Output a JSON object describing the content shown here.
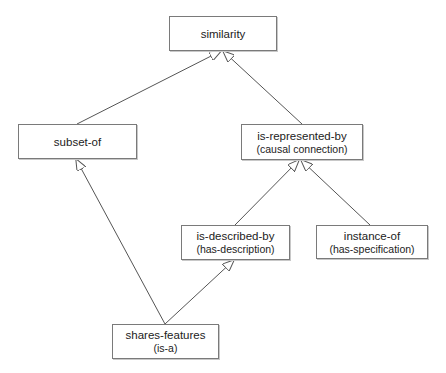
{
  "caption_cutoff": "",
  "diagram": {
    "nodes": [
      {
        "id": "similarity",
        "label": "similarity",
        "sublabel": ""
      },
      {
        "id": "subset-of",
        "label": "subset-of",
        "sublabel": ""
      },
      {
        "id": "is-represented-by",
        "label": "is-represented-by",
        "sublabel": "(causal connection)"
      },
      {
        "id": "is-described-by",
        "label": "is-described-by",
        "sublabel": "(has-description)"
      },
      {
        "id": "instance-of",
        "label": "instance-of",
        "sublabel": "(has-specification)"
      },
      {
        "id": "shares-features",
        "label": "shares-features",
        "sublabel": "(is-a)"
      }
    ],
    "edges": [
      {
        "from": "subset-of",
        "to": "similarity",
        "arrow": "hollow-triangle"
      },
      {
        "from": "is-represented-by",
        "to": "similarity",
        "arrow": "hollow-triangle"
      },
      {
        "from": "is-described-by",
        "to": "is-represented-by",
        "arrow": "hollow-triangle"
      },
      {
        "from": "instance-of",
        "to": "is-represented-by",
        "arrow": "hollow-triangle"
      },
      {
        "from": "shares-features",
        "to": "subset-of",
        "arrow": "hollow-triangle"
      },
      {
        "from": "shares-features",
        "to": "is-described-by",
        "arrow": "hollow-triangle"
      }
    ],
    "colors": {
      "line": "#555555",
      "border": "#7a7a7a",
      "background": "#ffffff"
    }
  }
}
